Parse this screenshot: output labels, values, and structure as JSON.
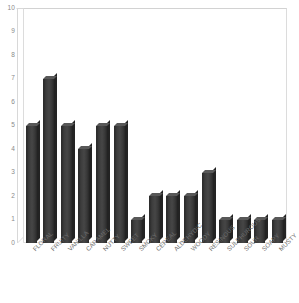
{
  "chart_data": {
    "type": "bar",
    "title": "",
    "subtitle": "",
    "xlabel": "",
    "ylabel": "",
    "categories": [
      "FLORAL",
      "FRUITY",
      "VANILLA",
      "CARAMEL",
      "NUTTY",
      "SWEET",
      "SMOKY",
      "CEREAL",
      "ALDEHYDIC",
      "WOODY",
      "RESINOUS",
      "SULPHUROUS",
      "SOUR",
      "SOAPY",
      "MUSTY"
    ],
    "values": [
      5,
      7,
      5,
      4,
      5,
      5,
      1,
      2,
      2,
      2,
      3,
      1,
      1,
      1,
      1
    ],
    "ylim": [
      0,
      10
    ],
    "ytick_labels": [
      "10",
      "9",
      "8",
      "7",
      "6",
      "5",
      "4",
      "3",
      "2",
      "1",
      "0"
    ],
    "ytick_values": [
      10,
      9,
      8,
      7,
      6,
      5,
      4,
      3,
      2,
      1,
      0
    ],
    "grid": false,
    "legend": false,
    "legend_position": "none",
    "style": "3d-column",
    "bar_color": "#3c3c3c",
    "bar_top_color": "#585858",
    "bar_side_color": "#232323",
    "axis_color": "#dcdcdc",
    "tick_label_color": "#8a8a8a",
    "category_label_color": "#6e6e6e",
    "background_color": "#ffffff",
    "category_label_rotation": -45
  }
}
